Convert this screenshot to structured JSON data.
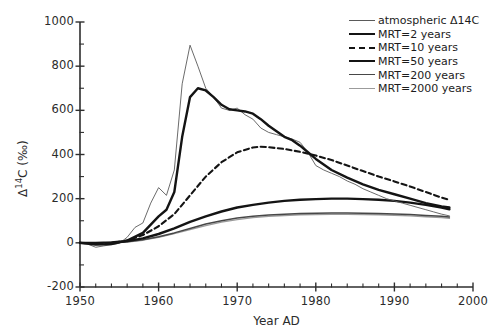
{
  "chart_data": {
    "type": "line",
    "title": "",
    "xlabel": "Year AD",
    "ylabel": "Δ 14C (‰)",
    "ylabel_parts": {
      "delta": "Δ",
      "mass": "14",
      "element": "C",
      "units": "(‰)"
    },
    "xlim": [
      1950,
      2000
    ],
    "ylim": [
      -200,
      1000
    ],
    "xticks": [
      1950,
      1960,
      1970,
      1980,
      1990,
      2000
    ],
    "xtick_labels": [
      "1950",
      "1960",
      "1970",
      "1980",
      "1990",
      "2000"
    ],
    "xtick_minor_step": 2,
    "yticks": [
      -200,
      0,
      200,
      400,
      600,
      800,
      1000
    ],
    "ytick_labels": [
      "-200",
      "0",
      "200",
      "400",
      "600",
      "800",
      "1000"
    ],
    "grid": false,
    "legend_position": "top-right",
    "series": [
      {
        "name": "atmospheric Δ14C",
        "legend_label": "atmospheric Δ14C",
        "style": "solid-thin",
        "color": "#5a5a5a",
        "width": 0.9,
        "x": [
          1950,
          1951,
          1952,
          1953,
          1954,
          1955,
          1956,
          1957,
          1958,
          1959,
          1960,
          1961,
          1962,
          1963,
          1964,
          1965,
          1966,
          1967,
          1968,
          1969,
          1970,
          1971,
          1972,
          1973,
          1974,
          1975,
          1976,
          1977,
          1978,
          1979,
          1980,
          1981,
          1982,
          1983,
          1984,
          1985,
          1986,
          1987,
          1988,
          1989,
          1990,
          1991,
          1992,
          1993,
          1994,
          1995,
          1996,
          1997
        ],
        "y": [
          0,
          -6,
          -20,
          -14,
          -8,
          -2,
          25,
          70,
          90,
          180,
          250,
          215,
          330,
          720,
          895,
          800,
          700,
          660,
          610,
          600,
          610,
          580,
          560,
          520,
          500,
          490,
          480,
          470,
          455,
          410,
          350,
          330,
          315,
          300,
          280,
          265,
          245,
          230,
          215,
          200,
          190,
          180,
          170,
          160,
          150,
          140,
          130,
          122
        ]
      },
      {
        "name": "MRT=2 years",
        "legend_label": "MRT=2 years",
        "style": "solid-thick",
        "color": "#141414",
        "width": 2.4,
        "x": [
          1950,
          1952,
          1954,
          1956,
          1958,
          1960,
          1961,
          1962,
          1963,
          1964,
          1965,
          1966,
          1967,
          1968,
          1969,
          1970,
          1971,
          1972,
          1973,
          1974,
          1975,
          1976,
          1977,
          1978,
          1979,
          1980,
          1982,
          1984,
          1986,
          1988,
          1990,
          1992,
          1994,
          1996,
          1997
        ],
        "y": [
          0,
          -8,
          -6,
          10,
          45,
          120,
          150,
          230,
          480,
          660,
          700,
          690,
          660,
          625,
          605,
          600,
          595,
          585,
          560,
          530,
          505,
          480,
          465,
          440,
          410,
          380,
          330,
          295,
          265,
          240,
          220,
          200,
          180,
          165,
          160
        ]
      },
      {
        "name": "MRT=10 years",
        "legend_label": "MRT=10 years",
        "style": "dashed",
        "color": "#141414",
        "width": 2.1,
        "x": [
          1950,
          1952,
          1954,
          1956,
          1958,
          1960,
          1962,
          1964,
          1966,
          1968,
          1970,
          1972,
          1973,
          1974,
          1976,
          1978,
          1980,
          1982,
          1984,
          1986,
          1988,
          1990,
          1992,
          1994,
          1996,
          1997
        ],
        "y": [
          0,
          -4,
          0,
          10,
          35,
          75,
          130,
          215,
          300,
          365,
          410,
          432,
          435,
          433,
          425,
          412,
          395,
          375,
          350,
          325,
          300,
          278,
          255,
          230,
          205,
          195
        ]
      },
      {
        "name": "MRT=50 years",
        "legend_label": "MRT=50 years",
        "style": "solid-thick",
        "color": "#141414",
        "width": 2.4,
        "x": [
          1950,
          1952,
          1954,
          1956,
          1958,
          1960,
          1962,
          1964,
          1966,
          1968,
          1970,
          1972,
          1974,
          1976,
          1978,
          1980,
          1982,
          1984,
          1986,
          1988,
          1990,
          1992,
          1994,
          1996,
          1997
        ],
        "y": [
          0,
          0,
          2,
          8,
          20,
          40,
          65,
          95,
          120,
          142,
          160,
          172,
          182,
          190,
          195,
          198,
          200,
          200,
          198,
          195,
          190,
          182,
          172,
          160,
          152
        ]
      },
      {
        "name": "MRT=200 years",
        "legend_label": "MRT=200 years",
        "style": "solid-medium",
        "color": "#474747",
        "width": 1.5,
        "x": [
          1950,
          1952,
          1954,
          1956,
          1958,
          1960,
          1962,
          1964,
          1966,
          1968,
          1970,
          1972,
          1974,
          1976,
          1978,
          1980,
          1982,
          1984,
          1986,
          1988,
          1990,
          1992,
          1994,
          1996,
          1997
        ],
        "y": [
          0,
          0,
          1,
          5,
          14,
          28,
          45,
          65,
          85,
          100,
          112,
          120,
          126,
          130,
          133,
          134,
          135,
          135,
          134,
          133,
          131,
          128,
          124,
          120,
          117
        ]
      },
      {
        "name": "MRT=2000 years",
        "legend_label": "MRT=2000 years",
        "style": "solid-light",
        "color": "#9b9b9b",
        "width": 1.4,
        "x": [
          1950,
          1952,
          1954,
          1956,
          1958,
          1960,
          1962,
          1964,
          1966,
          1968,
          1970,
          1972,
          1974,
          1976,
          1978,
          1980,
          1982,
          1984,
          1986,
          1988,
          1990,
          1992,
          1994,
          1996,
          1997
        ],
        "y": [
          0,
          0,
          1,
          4,
          12,
          25,
          42,
          60,
          78,
          94,
          105,
          114,
          120,
          124,
          127,
          128,
          129,
          129,
          128,
          127,
          125,
          122,
          118,
          114,
          111
        ]
      }
    ]
  },
  "legend": {
    "entries": [
      {
        "label": "atmospheric Δ14C",
        "series": 0
      },
      {
        "label": "MRT=2 years",
        "series": 1
      },
      {
        "label": "MRT=10 years",
        "series": 2
      },
      {
        "label": "MRT=50 years",
        "series": 3
      },
      {
        "label": "MRT=200 years",
        "series": 4
      },
      {
        "label": "MRT=2000 years",
        "series": 5
      }
    ]
  }
}
